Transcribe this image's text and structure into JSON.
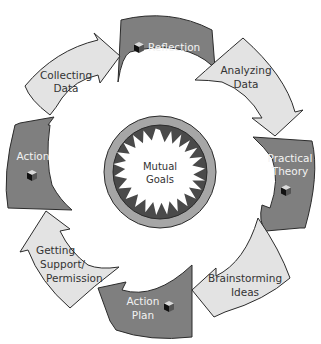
{
  "diagram": {
    "type": "cycle",
    "center": {
      "label_line1": "Mutual",
      "label_line2": "Goals"
    },
    "steps": [
      {
        "id": "reflection",
        "line1": "Reflection",
        "line2": "",
        "style": "dark",
        "icon": "cube-icon"
      },
      {
        "id": "analyzing-data",
        "line1": "Analyzing",
        "line2": "Data",
        "style": "light",
        "icon": ""
      },
      {
        "id": "practical-theory",
        "line1": "Practical",
        "line2": "Theory",
        "style": "dark",
        "icon": "cube-icon"
      },
      {
        "id": "brainstorming-ideas",
        "line1": "Brainstorming",
        "line2": "Ideas",
        "style": "light",
        "icon": ""
      },
      {
        "id": "action-plan",
        "line1": "Action",
        "line2": "Plan",
        "style": "dark",
        "icon": "cube-icon"
      },
      {
        "id": "getting-support",
        "line1": "Getting",
        "line2": "Support/",
        "line3": "Permission",
        "style": "light",
        "icon": ""
      },
      {
        "id": "action",
        "line1": "Action",
        "line2": "",
        "style": "dark",
        "icon": "cube-icon"
      },
      {
        "id": "collecting-data",
        "line1": "Collecting",
        "line2": "Data",
        "style": "light",
        "icon": ""
      }
    ],
    "colors": {
      "dark_arrow": "#7f7f7f",
      "light_arrow": "#e3e3e3",
      "outline": "#2b2b2b",
      "center_ring": "#a6a6a6",
      "center_disc": "#4a4a4a",
      "starburst": "#ffffff"
    }
  }
}
